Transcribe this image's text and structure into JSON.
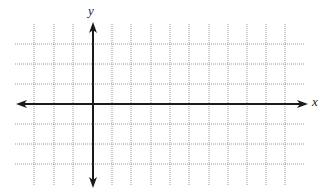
{
  "diagram": {
    "type": "coordinate-grid",
    "axes": {
      "x_label": "x",
      "y_label": "y",
      "color": "#1a1a1a"
    },
    "grid": {
      "color": "#9a9a9a",
      "style": "dotted",
      "vertical_lines_x": [
        34,
        54,
        73,
        93,
        112,
        131,
        151,
        170,
        189,
        209,
        228,
        247,
        266,
        285
      ],
      "horizontal_lines_y": [
        44,
        64,
        84,
        104,
        124,
        144,
        164
      ],
      "x_extent": [
        15,
        305
      ],
      "y_extent": [
        24,
        186
      ]
    },
    "origin": {
      "x": 93,
      "y": 104
    },
    "x_axis": {
      "x_start": 16,
      "x_end": 308,
      "y": 104
    },
    "y_axis": {
      "x": 93,
      "y_start": 22,
      "y_end": 188
    }
  }
}
